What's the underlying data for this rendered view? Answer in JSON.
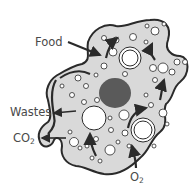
{
  "diagram": {
    "type": "amoeba-cell",
    "labels": {
      "food": "Food",
      "wastes": "Wastes",
      "co2_main": "CO",
      "co2_sub": "2",
      "o2_main": "O",
      "o2_sub": "2"
    },
    "colors": {
      "cytoplasm": "#d9d9d9",
      "outline": "#2a2a2a",
      "nucleus": "#5a5a5a",
      "vacuole": "#ffffff",
      "arrow": "#2a2a2a",
      "text": "#4a4a4a"
    }
  }
}
